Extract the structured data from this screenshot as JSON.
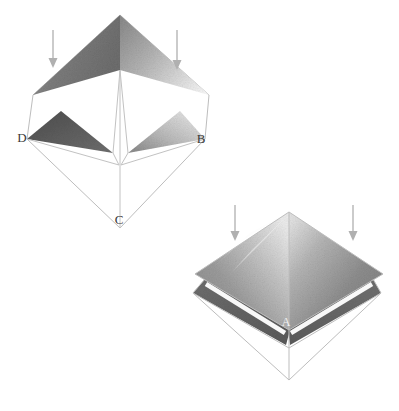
{
  "figure": {
    "background_color": "#ffffff",
    "caption_labels": [
      "D",
      "B",
      "C",
      "A"
    ],
    "figures": [
      {
        "name": "upper-pyramid-figure",
        "apex_label": "",
        "vertex_labels": [
          {
            "id": "D",
            "text": "D",
            "x": 22,
            "y": 142,
            "style": "dark"
          },
          {
            "id": "B",
            "text": "B",
            "x": 200,
            "y": 143,
            "style": "dark"
          },
          {
            "id": "C",
            "text": "C",
            "x": 118,
            "y": 222,
            "style": "dark"
          }
        ],
        "arrows": [
          {
            "id": "arrow-upper-left",
            "x": 53,
            "y1": 30,
            "y2": 66
          },
          {
            "id": "arrow-upper-right",
            "x": 177,
            "y1": 30,
            "y2": 69
          }
        ]
      },
      {
        "name": "lower-pyramid-figure",
        "vertex_labels": [
          {
            "id": "A",
            "text": "A",
            "x": 286,
            "y": 325,
            "style": "light"
          }
        ],
        "arrows": [
          {
            "id": "arrow-lower-left",
            "x": 235,
            "y1": 205,
            "y2": 241
          },
          {
            "id": "arrow-lower-right",
            "x": 353,
            "y1": 205,
            "y2": 241
          }
        ]
      }
    ],
    "colors": {
      "facet_mid_gray": "#7a7a7a",
      "facet_dark_gray": "#5c5c5c",
      "facet_light_gray": "#b4b4b4",
      "facet_pale_gray": "#d8d8d8",
      "edge_line": "#b9b9b9",
      "label_text": "#3a3a3a",
      "label_text_light": "#f2f2f2",
      "arrow_stroke": "#a8a8a8"
    }
  }
}
